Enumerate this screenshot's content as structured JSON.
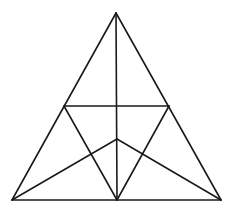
{
  "diagram": {
    "type": "geometry-figure",
    "stroke_color": "#1a1a1a",
    "background": "#ffffff",
    "points": {
      "A": [
        116,
        13
      ],
      "B": [
        12,
        200
      ],
      "C": [
        221,
        200
      ],
      "M": [
        117,
        200
      ],
      "D": [
        64,
        106
      ],
      "E": [
        169,
        106
      ],
      "P": [
        117,
        139
      ]
    },
    "segments": [
      {
        "id": "AB",
        "from": "A",
        "to": "B"
      },
      {
        "id": "AC",
        "from": "A",
        "to": "C"
      },
      {
        "id": "BC",
        "from": "B",
        "to": "C"
      },
      {
        "id": "AM",
        "from": "A",
        "to": "M"
      },
      {
        "id": "DE",
        "from": "D",
        "to": "E"
      },
      {
        "id": "DM",
        "from": "D",
        "to": "M"
      },
      {
        "id": "EM",
        "from": "E",
        "to": "M"
      },
      {
        "id": "BP",
        "from": "B",
        "to": "P"
      },
      {
        "id": "CP",
        "from": "C",
        "to": "P"
      }
    ]
  }
}
